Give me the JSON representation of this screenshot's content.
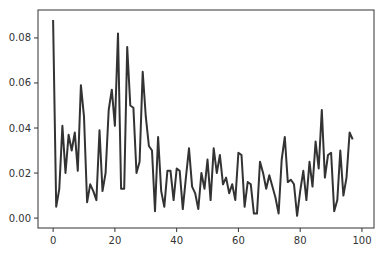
{
  "chart_data": {
    "type": "line",
    "title": "",
    "xlabel": "",
    "ylabel": "",
    "xlim": [
      -4.9,
      103.9
    ],
    "ylim": [
      -0.0044,
      0.0924
    ],
    "grid": false,
    "legend": null,
    "xticks": [
      0,
      20,
      40,
      60,
      80,
      100
    ],
    "xtick_labels": [
      "0",
      "20",
      "40",
      "60",
      "80",
      "100"
    ],
    "yticks": [
      0.0,
      0.02,
      0.04,
      0.06,
      0.08
    ],
    "ytick_labels": [
      "0.00",
      "0.02",
      "0.04",
      "0.06",
      "0.08"
    ],
    "series": [
      {
        "name": "series",
        "color": "#333333",
        "x": [
          0,
          1,
          2,
          3,
          4,
          5,
          6,
          7,
          8,
          9,
          10,
          11,
          12,
          13,
          14,
          15,
          16,
          17,
          18,
          19,
          20,
          21,
          22,
          23,
          24,
          25,
          26,
          27,
          28,
          29,
          30,
          31,
          32,
          33,
          34,
          35,
          36,
          37,
          38,
          39,
          40,
          41,
          42,
          43,
          44,
          45,
          46,
          47,
          48,
          49,
          50,
          51,
          52,
          53,
          54,
          55,
          56,
          57,
          58,
          59,
          60,
          61,
          62,
          63,
          64,
          65,
          66,
          67,
          68,
          69,
          70,
          71,
          72,
          73,
          74,
          75,
          76,
          77,
          78,
          79,
          80,
          81,
          82,
          83,
          84,
          85,
          86,
          87,
          88,
          89,
          90,
          91,
          92,
          93,
          94,
          95,
          96,
          97
        ],
        "values": [
          0.088,
          0.005,
          0.013,
          0.041,
          0.02,
          0.037,
          0.03,
          0.038,
          0.021,
          0.059,
          0.045,
          0.007,
          0.015,
          0.012,
          0.008,
          0.039,
          0.012,
          0.02,
          0.048,
          0.057,
          0.041,
          0.082,
          0.013,
          0.013,
          0.076,
          0.05,
          0.049,
          0.02,
          0.025,
          0.065,
          0.045,
          0.032,
          0.03,
          0.003,
          0.036,
          0.012,
          0.005,
          0.021,
          0.021,
          0.008,
          0.022,
          0.021,
          0.004,
          0.018,
          0.031,
          0.014,
          0.011,
          0.004,
          0.02,
          0.013,
          0.026,
          0.008,
          0.031,
          0.02,
          0.028,
          0.015,
          0.018,
          0.011,
          0.015,
          0.008,
          0.029,
          0.028,
          0.005,
          0.016,
          0.015,
          0.002,
          0.002,
          0.025,
          0.02,
          0.013,
          0.019,
          0.014,
          0.009,
          0.002,
          0.026,
          0.036,
          0.016,
          0.017,
          0.015,
          0.001,
          0.012,
          0.021,
          0.008,
          0.025,
          0.014,
          0.034,
          0.022,
          0.048,
          0.018,
          0.028,
          0.029,
          0.003,
          0.008,
          0.03,
          0.01,
          0.018,
          0.038,
          0.035
        ]
      }
    ]
  },
  "layout": {
    "plot_left": 38,
    "plot_right": 374,
    "plot_top": 10,
    "plot_bottom": 228
  }
}
